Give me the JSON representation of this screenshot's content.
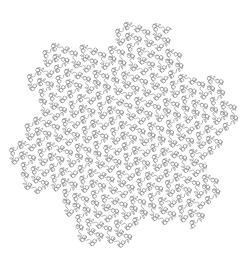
{
  "image": {
    "title": "Gosper Curve Fractal",
    "kind": "line-drawing",
    "width": 246,
    "height": 269,
    "background_color": "#ffffff"
  },
  "figure": {
    "name": "gosper-flowsnake-loop-curve",
    "stroke_color": "#8a8a8a",
    "stroke_width": 0.62,
    "fill": "none",
    "line_cap": "round",
    "line_join": "round"
  },
  "chart_data": {
    "type": "line",
    "xlabel": "",
    "ylabel": "",
    "grid": false,
    "legend": null,
    "axis_visible": false,
    "curve": {
      "family": "L-system",
      "name": "Gosper curve (flowsnake)",
      "axiom": "A",
      "rules": {
        "A": "A-B--B+A++AA+B-",
        "B": "+A-BB--B-A++A+B"
      },
      "angle_degrees": 60,
      "iterations": 4,
      "segment_count": 2401,
      "corner_style": "loop",
      "loop_radius_ratio": 0.46,
      "start_heading_degrees": -19
    },
    "extent": {
      "x_min": 8,
      "x_max": 238,
      "y_min": 19,
      "y_max": 251
    }
  }
}
